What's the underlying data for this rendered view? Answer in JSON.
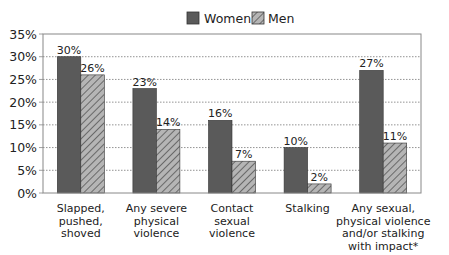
{
  "chart_data": {
    "type": "bar",
    "title": "",
    "xlabel": "",
    "ylabel": "",
    "ylim": [
      0,
      35
    ],
    "yticks": [
      "0%",
      "5%",
      "10%",
      "15%",
      "20%",
      "25%",
      "30%",
      "35%"
    ],
    "grid": "horizontal dotted",
    "legend_position": "top",
    "categories": [
      [
        "Slapped,",
        "pushed,",
        "shoved"
      ],
      [
        "Any severe",
        "physical",
        "violence"
      ],
      [
        "Contact",
        "sexual",
        "violence"
      ],
      [
        "Stalking"
      ],
      [
        "Any sexual,",
        "physical violence",
        "and/or stalking",
        "with impact*"
      ]
    ],
    "series": [
      {
        "name": "Women",
        "values": [
          30,
          23,
          16,
          10,
          27
        ],
        "labels": [
          "30%",
          "23%",
          "16%",
          "10%",
          "27%"
        ],
        "color": "#5a5a5a",
        "pattern": "solid"
      },
      {
        "name": "Men",
        "values": [
          26,
          14,
          7,
          2,
          11
        ],
        "labels": [
          "26%",
          "14%",
          "7%",
          "2%",
          "11%"
        ],
        "color": "#9a9a9a",
        "pattern": "hatched"
      }
    ]
  },
  "legend": {
    "women": "Women",
    "men": "Men"
  }
}
